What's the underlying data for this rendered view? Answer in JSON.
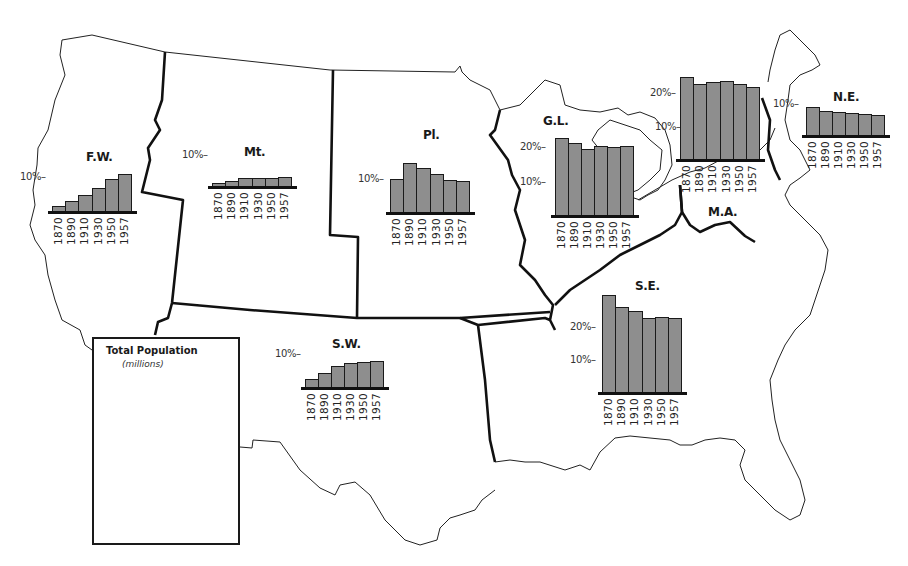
{
  "chart_data": {
    "type": "bar",
    "categories": [
      "1870",
      "1890",
      "1910",
      "1930",
      "1950",
      "1957"
    ],
    "charts": [
      {
        "id": "fw",
        "region": "F.W.",
        "ylabel": "% of U.S. population",
        "ticks": [
          "10%"
        ],
        "values": [
          1.7,
          3.1,
          4.7,
          6.6,
          9.2,
          10.6
        ]
      },
      {
        "id": "mt",
        "region": "Mt.",
        "ylabel": "% of U.S. population",
        "ticks": [
          "10%"
        ],
        "values": [
          1.2,
          1.9,
          2.8,
          2.8,
          2.8,
          3.1
        ]
      },
      {
        "id": "pl",
        "region": "Pl.",
        "ylabel": "% of U.S. population",
        "ticks": [
          "10%"
        ],
        "values": [
          10.0,
          14.7,
          13.2,
          11.5,
          9.7,
          9.4
        ]
      },
      {
        "id": "gl",
        "region": "G.L.",
        "ylabel": "% of U.S. population",
        "ticks": [
          "10%",
          "20%"
        ],
        "values": [
          22.6,
          21.1,
          19.4,
          20.3,
          20.0,
          20.3
        ]
      },
      {
        "id": "ma",
        "region": "M.A.",
        "ylabel": "% of U.S. population",
        "ticks": [
          "10%",
          "20%"
        ],
        "values": [
          24.8,
          22.7,
          23.3,
          23.6,
          22.7,
          21.8
        ]
      },
      {
        "id": "ne",
        "region": "N.E.",
        "ylabel": "% of U.S. population",
        "ticks": [
          "10%"
        ],
        "values": [
          9.1,
          7.8,
          7.5,
          7.2,
          6.9,
          6.6
        ]
      },
      {
        "id": "se",
        "region": "S.E.",
        "ylabel": "% of U.S. population",
        "ticks": [
          "10%",
          "20%"
        ],
        "values": [
          29.7,
          26.1,
          24.8,
          22.7,
          23.0,
          22.7
        ]
      },
      {
        "id": "sw",
        "region": "S.W.",
        "ylabel": "% of U.S. population",
        "ticks": [
          "10%"
        ],
        "values": [
          2.7,
          4.5,
          6.7,
          7.6,
          7.9,
          8.2
        ]
      },
      {
        "id": "total",
        "region": "Total Population",
        "ylabel": "(millions)",
        "ticks": [
          "50",
          "100",
          "150"
        ],
        "values": [
          39,
          64,
          94,
          124,
          154,
          172
        ],
        "ylim": [
          0,
          180
        ]
      }
    ],
    "grid": false,
    "legend": "none"
  },
  "total": {
    "title": "Total Population",
    "subtitle": "(millions)"
  },
  "colors": {
    "bar_fill": "#8e8e8e",
    "bar_outline": "#1a1a1a",
    "boundary": "#111111",
    "coastline": "#222222"
  }
}
